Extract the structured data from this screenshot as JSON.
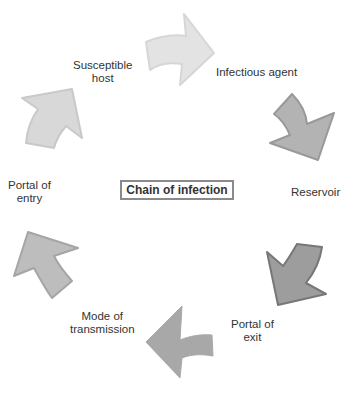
{
  "diagram": {
    "title": "Chain of infection",
    "type": "cycle",
    "nodes": [
      {
        "id": "infectious-agent",
        "label": "Infectious agent",
        "lines": [
          "Infectious agent"
        ]
      },
      {
        "id": "reservoir",
        "label": "Reservoir",
        "lines": [
          "Reservoir"
        ]
      },
      {
        "id": "portal-of-exit",
        "label": "Portal of exit",
        "lines": [
          "Portal of",
          "exit"
        ]
      },
      {
        "id": "mode-of-transmission",
        "label": "Mode of transmission",
        "lines": [
          "Mode of",
          "transmission"
        ]
      },
      {
        "id": "portal-of-entry",
        "label": "Portal of entry",
        "lines": [
          "Portal of",
          "entry"
        ]
      },
      {
        "id": "susceptible-host",
        "label": "Susceptible host",
        "lines": [
          "Susceptible",
          "host"
        ]
      }
    ],
    "arrows": [
      {
        "from": "susceptible-host",
        "to": "infectious-agent",
        "direction": "right",
        "fill": "#e3e3e3",
        "stroke": "#d6d6d6"
      },
      {
        "from": "infectious-agent",
        "to": "reservoir",
        "direction": "down",
        "fill": "#b3b3b3",
        "stroke": "#999999"
      },
      {
        "from": "reservoir",
        "to": "portal-of-exit",
        "direction": "down-left",
        "fill": "#9d9d9d",
        "stroke": "#777777"
      },
      {
        "from": "portal-of-exit",
        "to": "mode-of-transmission",
        "direction": "left",
        "fill": "#a8a8a8",
        "stroke": "#a8a8a8"
      },
      {
        "from": "mode-of-transmission",
        "to": "portal-of-entry",
        "direction": "up-left",
        "fill": "#bdbdbd",
        "stroke": "#a5a5a5"
      },
      {
        "from": "portal-of-entry",
        "to": "susceptible-host",
        "direction": "up-right",
        "fill": "#d8d8d8",
        "stroke": "#c9c9c9"
      }
    ]
  }
}
